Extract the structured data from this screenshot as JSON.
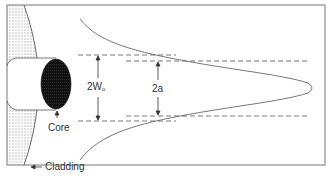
{
  "diagram": {
    "type": "optical-fiber-mode-field",
    "labels": {
      "mode_field_diameter": "2W",
      "mode_field_subscript": "o",
      "core_diameter": "2a",
      "core": "Core",
      "cladding": "Cladding"
    },
    "colors": {
      "line": "#555555",
      "frame": "#777777",
      "core_fill": "#111111",
      "hatch": "#999999",
      "background": "#ffffff"
    }
  }
}
